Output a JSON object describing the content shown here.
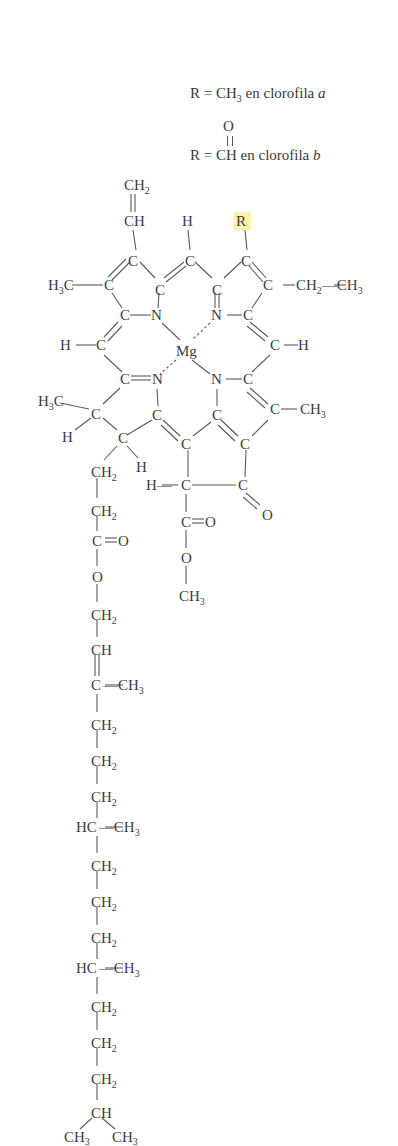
{
  "legend": {
    "line_a": {
      "prefix": "R = CH",
      "sub": "3",
      "suffix": " en clorofila ",
      "variant": "a"
    },
    "line_b_oxygen": "O",
    "line_b": {
      "prefix": "R = CH",
      "suffix": " en clorofila ",
      "variant": "b"
    }
  },
  "molecule": {
    "name": "clorofila",
    "central_metal": "Mg",
    "r_group_label": "R",
    "r_group_highlight": "#fbf3a6",
    "atoms": [
      {
        "id": "vinyl_ch2",
        "label": "CH",
        "sub": "2",
        "x": 128,
        "y": 190
      },
      {
        "id": "vinyl_ch",
        "label": "CH",
        "x": 128,
        "y": 226
      },
      {
        "id": "h_top",
        "label": "H",
        "x": 183,
        "y": 226
      },
      {
        "id": "r",
        "label": "R",
        "x": 241,
        "y": 226
      },
      {
        "id": "c1",
        "label": "C",
        "x": 132,
        "y": 262
      },
      {
        "id": "c2",
        "label": "C",
        "x": 186,
        "y": 262
      },
      {
        "id": "c3",
        "label": "C",
        "x": 243,
        "y": 262
      },
      {
        "id": "h3c_left",
        "label": "H",
        "sub": "3",
        "tail": "C",
        "x": 50,
        "y": 290
      },
      {
        "id": "c4",
        "label": "C",
        "x": 106,
        "y": 290
      },
      {
        "id": "c5",
        "label": "C",
        "x": 155,
        "y": 290
      },
      {
        "id": "c6",
        "label": "C",
        "x": 214,
        "y": 290
      },
      {
        "id": "c7",
        "label": "C",
        "x": 262,
        "y": 290
      },
      {
        "id": "ethyl",
        "label": "CH",
        "sub": "2",
        "tail2": "CH",
        "sub2": "3",
        "x": 277,
        "y": 290
      },
      {
        "id": "c8",
        "label": "C",
        "x": 121,
        "y": 320
      },
      {
        "id": "n1",
        "label": "N",
        "x": 153,
        "y": 320
      },
      {
        "id": "n2",
        "label": "N",
        "x": 212,
        "y": 320
      },
      {
        "id": "c9",
        "label": "C",
        "x": 243,
        "y": 320
      },
      {
        "id": "h_left",
        "label": "H",
        "x": 62,
        "y": 350
      },
      {
        "id": "c10",
        "label": "C",
        "x": 98,
        "y": 350
      },
      {
        "id": "mg",
        "label": "Mg",
        "x": 180,
        "y": 355
      },
      {
        "id": "c11",
        "label": "C",
        "x": 273,
        "y": 350
      },
      {
        "id": "h_right",
        "label": "H",
        "x": 300,
        "y": 350
      },
      {
        "id": "c12",
        "label": "C",
        "x": 122,
        "y": 384
      },
      {
        "id": "n3",
        "label": "N",
        "x": 152,
        "y": 384
      },
      {
        "id": "n4",
        "label": "N",
        "x": 212,
        "y": 384
      },
      {
        "id": "c13",
        "label": "C",
        "x": 243,
        "y": 384
      },
      {
        "id": "h3c_mid",
        "label": "H",
        "sub": "3",
        "tail": "C",
        "x": 38,
        "y": 406
      },
      {
        "id": "c14",
        "label": "C",
        "x": 94,
        "y": 414
      },
      {
        "id": "c15",
        "label": "C",
        "x": 155,
        "y": 420
      },
      {
        "id": "c16",
        "label": "C",
        "x": 214,
        "y": 420
      },
      {
        "id": "c17",
        "label": "C",
        "x": 272,
        "y": 414
      },
      {
        "id": "ch3_right",
        "label": "CH",
        "sub": "3",
        "x": 301,
        "y": 414
      },
      {
        "id": "h_c14",
        "label": "H",
        "x": 62,
        "y": 440
      },
      {
        "id": "c18",
        "label": "C",
        "x": 119,
        "y": 440
      },
      {
        "id": "c19",
        "label": "C",
        "x": 184,
        "y": 446
      },
      {
        "id": "c20",
        "label": "C",
        "x": 242,
        "y": 446
      },
      {
        "id": "ch2_a",
        "label": "CH",
        "sub": "2",
        "x": 93,
        "y": 474
      },
      {
        "id": "h_c18",
        "label": "H",
        "x": 138,
        "y": 472
      },
      {
        "id": "h_c21",
        "label": "H",
        "x": 148,
        "y": 490
      },
      {
        "id": "c21",
        "label": "C",
        "x": 181,
        "y": 490
      },
      {
        "id": "c22",
        "label": "C",
        "x": 237,
        "y": 490
      },
      {
        "id": "o_ketone",
        "label": "O",
        "x": 264,
        "y": 517
      },
      {
        "id": "ch2_b",
        "label": "CH",
        "sub": "2",
        "x": 93,
        "y": 512
      },
      {
        "id": "c_ester1",
        "label": "C",
        "x": 180,
        "y": 526
      },
      {
        "id": "o_ester1",
        "label": "O",
        "x": 206,
        "y": 526
      },
      {
        "id": "c_ester2",
        "label": "C",
        "x": 93,
        "y": 545
      },
      {
        "id": "o_ester2",
        "label": "O",
        "x": 119,
        "y": 545
      },
      {
        "id": "o_me",
        "label": "O",
        "x": 180,
        "y": 561
      },
      {
        "id": "o_chain",
        "label": "O",
        "x": 93,
        "y": 580
      },
      {
        "id": "ch3_me",
        "label": "CH",
        "sub": "3",
        "x": 180,
        "y": 598
      }
    ],
    "phytyl_chain": [
      {
        "label": "CH",
        "sub": "2",
        "y": 616
      },
      {
        "label": "CH",
        "y": 651
      },
      {
        "label": "C",
        "branch": "CH",
        "branch_sub": "3",
        "y": 690
      },
      {
        "label": "CH",
        "sub": "2",
        "y": 726
      },
      {
        "label": "CH",
        "sub": "2",
        "y": 762
      },
      {
        "label": "CH",
        "sub": "2",
        "y": 798
      },
      {
        "label": "HC",
        "branch": "CH",
        "branch_sub": "3",
        "y": 832
      },
      {
        "label": "CH",
        "sub": "2",
        "y": 867
      },
      {
        "label": "CH",
        "sub": "2",
        "y": 903
      },
      {
        "label": "CH",
        "sub": "2",
        "y": 939
      },
      {
        "label": "HC",
        "branch": "CH",
        "branch_sub": "3",
        "y": 973
      },
      {
        "label": "CH",
        "sub": "2",
        "y": 1008
      },
      {
        "label": "CH",
        "sub": "2",
        "y": 1044
      },
      {
        "label": "CH",
        "sub": "2",
        "y": 1080
      },
      {
        "label": "CH",
        "y": 1114
      }
    ],
    "terminal_methyls": [
      {
        "label": "CH",
        "sub": "3",
        "x": 74,
        "y": 1142
      },
      {
        "label": "CH",
        "sub": "3",
        "x": 122,
        "y": 1142
      }
    ]
  }
}
